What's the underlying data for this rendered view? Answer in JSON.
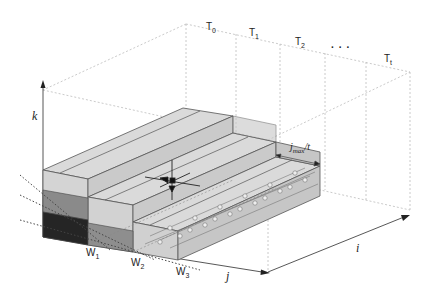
{
  "diagram": {
    "time_labels": [
      {
        "base": "T",
        "sub": "0"
      },
      {
        "base": "T",
        "sub": "1"
      },
      {
        "base": "T",
        "sub": "2"
      },
      {
        "base": "...",
        "sub": ""
      },
      {
        "base": "T",
        "sub": "t"
      }
    ],
    "axes": {
      "k": "k",
      "j": "j",
      "i": "i"
    },
    "width_labels": [
      {
        "base": "W",
        "sub": "1"
      },
      {
        "base": "W",
        "sub": "2"
      },
      {
        "base": "W",
        "sub": "3"
      }
    ],
    "dimension_label": {
      "base": "j",
      "sub": "max",
      "suffix": "/t"
    },
    "colors": {
      "block_top": "#dcdcdc",
      "block_front": "#d0d0d0",
      "block_side": "#c4c4c4",
      "cell_dark": "#262626",
      "cell_mid": "#8a8a8a",
      "cell_light": "#bdbdbd",
      "guide": "#bbbbbb",
      "edge": "#555555"
    }
  }
}
